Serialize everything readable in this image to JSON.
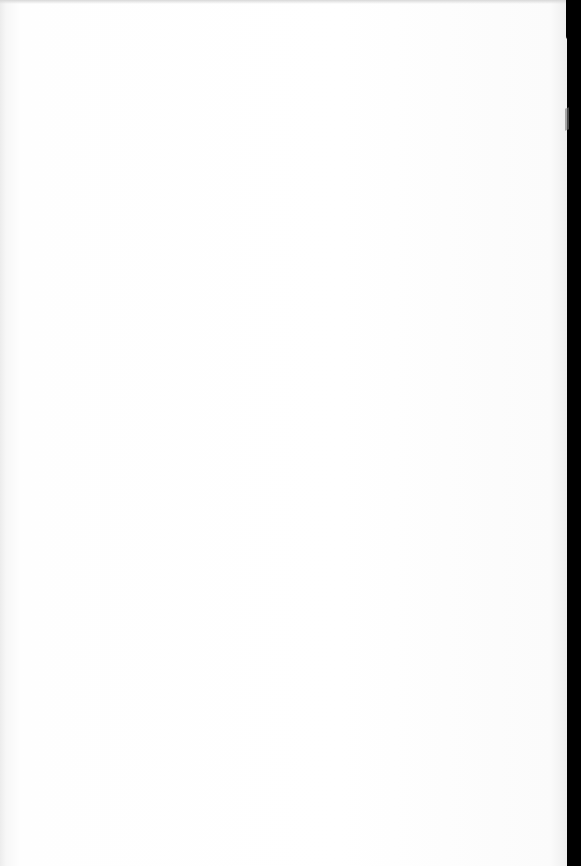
{
  "document": {
    "type": "scanned-page",
    "content": "blank",
    "bleed_through_text": [
      "",
      "",
      ""
    ]
  },
  "colors": {
    "page": "#ffffff",
    "scan_border": "#000000"
  }
}
